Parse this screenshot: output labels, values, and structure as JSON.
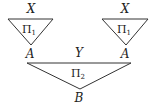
{
  "diagram": {
    "left_triangle": {
      "top_label": "X",
      "inner_label": "Π",
      "inner_sub": "1",
      "apex_label": "A"
    },
    "right_triangle": {
      "top_label": "X",
      "inner_label": "Π",
      "inner_sub": "1",
      "apex_label": "A"
    },
    "bottom_triangle": {
      "top_label": "Y",
      "inner_label": "Π",
      "inner_sub": "2",
      "apex_label": "B"
    }
  }
}
